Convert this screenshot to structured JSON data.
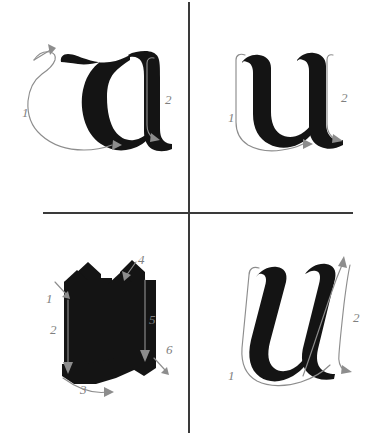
{
  "page": {
    "background_color": "#ffffff",
    "ink_color": "#141414",
    "guide_color": "#8d8d8d",
    "divider_color": "#3a3a3a"
  },
  "panels": [
    {
      "id": "top-left",
      "letter": "u",
      "script_style": "rotunda uncial u",
      "stroke_count": 2,
      "strokes": [
        {
          "number": "1",
          "label_x": 22,
          "label_y": 112,
          "direction": "hook down, curve around bowl, exit right"
        },
        {
          "number": "2",
          "label_x": 166,
          "label_y": 100,
          "direction": "down the right stem, exit right"
        }
      ]
    },
    {
      "id": "top-right",
      "letter": "u",
      "script_style": "rounded gothic u",
      "stroke_count": 2,
      "strokes": [
        {
          "number": "1",
          "label_x": 43,
          "label_y": 118,
          "direction": "down left stem, curve along base to the right"
        },
        {
          "number": "2",
          "label_x": 155,
          "label_y": 98,
          "direction": "down the right stem, exit right"
        }
      ]
    },
    {
      "id": "bottom-left",
      "letter": "u",
      "script_style": "textura blackletter u",
      "stroke_count": 6,
      "strokes": [
        {
          "number": "1",
          "label_x": 53,
          "label_y": 299,
          "direction": "short diagonal serif down-right"
        },
        {
          "number": "2",
          "label_x": 46,
          "label_y": 330,
          "direction": "long vertical stem downward"
        },
        {
          "number": "3",
          "label_x": 77,
          "label_y": 388,
          "direction": "curved foot sweeping right"
        },
        {
          "number": "4",
          "label_x": 141,
          "label_y": 275,
          "direction": "short diagonal serif down-right"
        },
        {
          "number": "5",
          "label_x": 148,
          "label_y": 321,
          "direction": "long vertical stem downward"
        },
        {
          "number": "6",
          "label_x": 160,
          "label_y": 349,
          "direction": "short diagonal foot down-right"
        }
      ]
    },
    {
      "id": "bottom-right",
      "letter": "u",
      "script_style": "italic cursive u",
      "stroke_count": 2,
      "strokes": [
        {
          "number": "1",
          "label_x": 44,
          "label_y": 157,
          "direction": "down left stroke, curve across base to the right"
        },
        {
          "number": "2",
          "label_x": 160,
          "label_y": 100,
          "direction": "up then down the right stroke, exit right"
        }
      ]
    }
  ]
}
